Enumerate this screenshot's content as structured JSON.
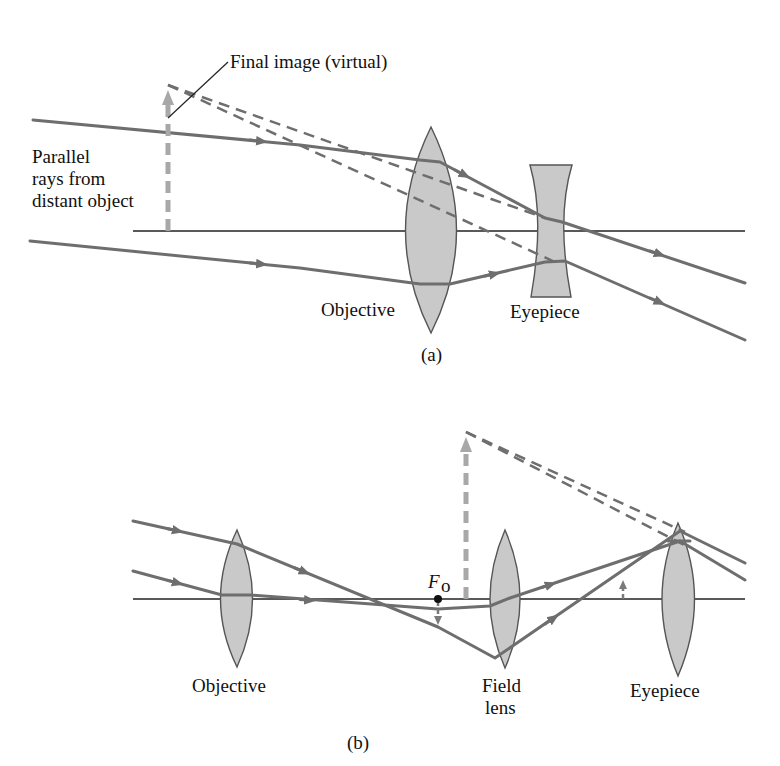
{
  "figure_a": {
    "caption": "(a)",
    "labels": {
      "final_image": "Final image (virtual)",
      "parallel_rays_line1": "Parallel",
      "parallel_rays_line2": "rays from",
      "parallel_rays_line3": "distant object",
      "objective": "Objective",
      "eyepiece": "Eyepiece"
    }
  },
  "figure_b": {
    "caption": "(b)",
    "labels": {
      "focal_point": "F",
      "focal_point_sub": "o",
      "objective": "Objective",
      "field_lens_line1": "Field",
      "field_lens_line2": "lens",
      "eyepiece": "Eyepiece"
    }
  },
  "colors": {
    "ray": "#6e6e6e",
    "lens_fill": "#c9c9c9",
    "axis": "#222222",
    "image_arrow": "#a8a8a8"
  }
}
